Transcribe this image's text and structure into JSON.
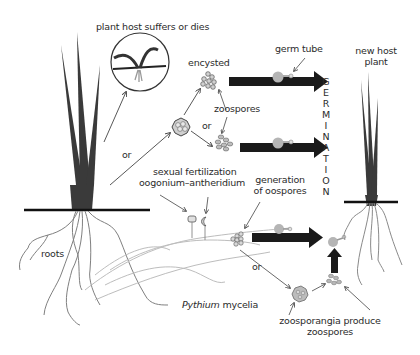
{
  "diagram": {
    "labels": {
      "plant_host_suffers": "plant host suffers or dies",
      "encysted": "encysted",
      "germ_tube": "germ tube",
      "new_host_plant_line1": "new host",
      "new_host_plant_line2": "plant",
      "zoospores": "zoospores",
      "or_top": "or",
      "or_left": "or",
      "or_bottom": "or",
      "sexual_fertilization_line1": "sexual fertilization",
      "sexual_fertilization_line2": "oogonium–antheridium",
      "generation_oospores_line1": "generation",
      "generation_oospores_line2": "of oospores",
      "roots": "roots",
      "pythium_italic": "Pythium",
      "mycelia": " mycelia",
      "zoosporangia_line1": "zoosporangia produce",
      "zoosporangia_line2": "zoospores"
    },
    "germination_letters": [
      "G",
      "E",
      "R",
      "M",
      "I",
      "N",
      "A",
      "T",
      "I",
      "O",
      "N"
    ],
    "colors": {
      "leaf": "#3a3a3a",
      "ground": "#111111",
      "arrow": "#1a1a1a",
      "root": "#8a8a8a",
      "spore": "#b0b0b0",
      "text": "#2b2b2b"
    }
  }
}
